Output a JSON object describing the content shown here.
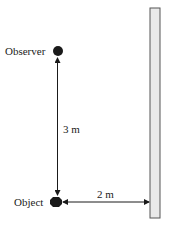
{
  "diagram": {
    "observer": {
      "label": "Observer"
    },
    "object": {
      "label": "Object"
    },
    "vertical_distance": {
      "label": "3 m"
    },
    "horizontal_distance": {
      "label": "2 m"
    },
    "mirror": {
      "name": "plane mirror"
    }
  },
  "colors": {
    "ink": "#1a1a1a",
    "mirror_fill": "#e9e9e9",
    "mirror_stroke": "#555555"
  }
}
